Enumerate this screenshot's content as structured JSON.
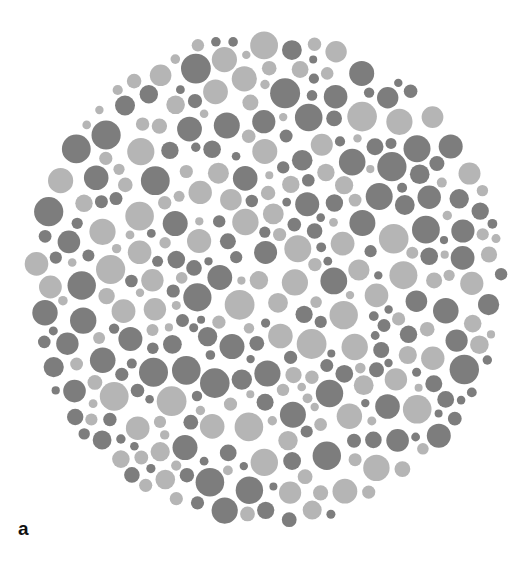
{
  "figure": {
    "panel_label": "a",
    "plate": {
      "center_x": 265,
      "center_y": 279,
      "radius_x": 243,
      "radius_y": 250,
      "dot_colors": {
        "dark": "#7d7d7d",
        "light": "#b5b5b5",
        "background": "#ffffff"
      },
      "dot_radius_min": 4,
      "dot_radius_max": 15,
      "dot_gap": 2,
      "dark_ratio": 0.5,
      "seed": 7
    }
  }
}
